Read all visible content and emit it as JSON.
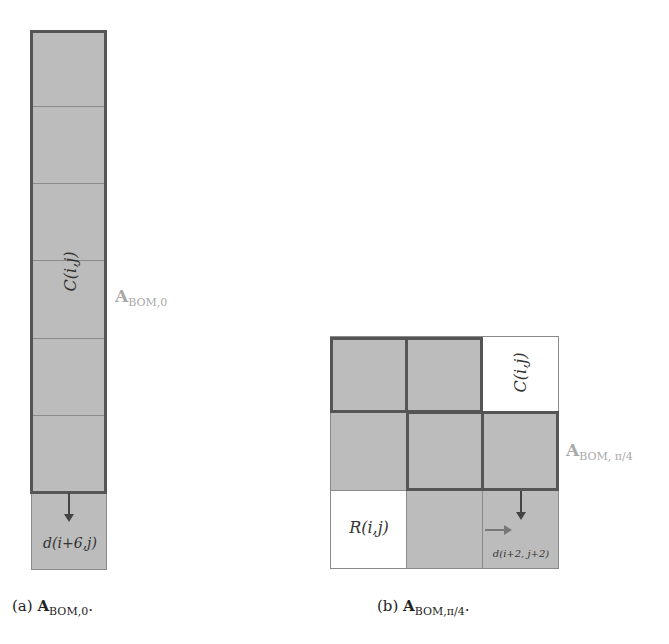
{
  "figure_a": {
    "column_cells": 7,
    "block_label": "C(i,j)",
    "matrix_label_main": "A",
    "matrix_label_sub": "BOM,0",
    "dep_label": "d(i+6,j)",
    "caption_prefix": "(a)",
    "caption_main": "A",
    "caption_sub": "BOM,0",
    "caption_suffix": "."
  },
  "figure_b": {
    "grid_size": "3x3",
    "white_cells": [
      "(0,2)",
      "(2,0)"
    ],
    "c_label": "C(i,j)",
    "r_label": "R(i,j)",
    "matrix_label_main": "A",
    "matrix_label_sub": "BOM, π/4",
    "dep_label": "d(i+2, j+2)",
    "caption_prefix": "(b)",
    "caption_main": "A",
    "caption_sub": "BOM,π/4",
    "caption_suffix": "."
  },
  "colors": {
    "cell_fill": "#bcbcbc",
    "thick_border": "#555555",
    "label_gray": "#a8a8a8"
  }
}
